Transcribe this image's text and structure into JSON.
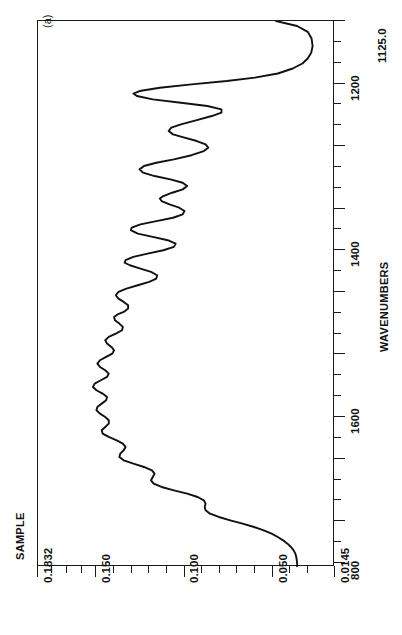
{
  "figure": {
    "panel_label": "(a)",
    "background_color": "#ffffff",
    "line_color": "#111111"
  },
  "chart_data": {
    "type": "line",
    "title": "",
    "subtitle": "",
    "orientation": "rotated-90",
    "xlabel": "WAVENUMBERS",
    "ylabel": "SAMPLE",
    "x_is_vertical_axis": true,
    "xlim": [
      1780,
      1125.0
    ],
    "ylim": [
      0.1832,
      0.0145
    ],
    "x_axis_end_label": "1125.0",
    "grid": false,
    "legend": null,
    "x_major_ticks": [
      1200,
      1400,
      1600,
      800
    ],
    "x_tick_labels": [
      "1200",
      "1400",
      "1600",
      "800"
    ],
    "y_major_ticks": [
      0.1832,
      0.15,
      0.1,
      0.05,
      0.0145
    ],
    "y_tick_labels": [
      "0.1832",
      "0.150",
      "0.100",
      "0.050",
      "0.0145"
    ],
    "series": [
      {
        "name": "SAMPLE",
        "x_label": "wavenumber (cm-1)",
        "y_label": "absorbance",
        "points": [
          [
            1125,
            0.048
          ],
          [
            1131,
            0.036
          ],
          [
            1138,
            0.03
          ],
          [
            1146,
            0.0278
          ],
          [
            1155,
            0.0272
          ],
          [
            1163,
            0.028
          ],
          [
            1170,
            0.03
          ],
          [
            1176,
            0.033
          ],
          [
            1182,
            0.0385
          ],
          [
            1188,
            0.047
          ],
          [
            1193,
            0.06
          ],
          [
            1197,
            0.076
          ],
          [
            1201,
            0.096
          ],
          [
            1205,
            0.114
          ],
          [
            1209,
            0.1255
          ],
          [
            1212,
            0.129
          ],
          [
            1215,
            0.127
          ],
          [
            1219,
            0.118
          ],
          [
            1223,
            0.102
          ],
          [
            1227,
            0.087
          ],
          [
            1231,
            0.079
          ],
          [
            1235,
            0.079
          ],
          [
            1239,
            0.0845
          ],
          [
            1244,
            0.093
          ],
          [
            1249,
            0.102
          ],
          [
            1253,
            0.1075
          ],
          [
            1257,
            0.109
          ],
          [
            1261,
            0.1065
          ],
          [
            1265,
            0.1
          ],
          [
            1269,
            0.093
          ],
          [
            1273,
            0.088
          ],
          [
            1277,
            0.0865
          ],
          [
            1281,
            0.089
          ],
          [
            1286,
            0.096
          ],
          [
            1291,
            0.106
          ],
          [
            1295,
            0.116
          ],
          [
            1299,
            0.123
          ],
          [
            1303,
            0.1255
          ],
          [
            1307,
            0.1235
          ],
          [
            1311,
            0.117
          ],
          [
            1315,
            0.108
          ],
          [
            1319,
            0.101
          ],
          [
            1323,
            0.0985
          ],
          [
            1327,
            0.101
          ],
          [
            1331,
            0.107
          ],
          [
            1335,
            0.112
          ],
          [
            1338,
            0.114
          ],
          [
            1341,
            0.113
          ],
          [
            1345,
            0.1085
          ],
          [
            1349,
            0.103
          ],
          [
            1353,
            0.1
          ],
          [
            1357,
            0.101
          ],
          [
            1361,
            0.1065
          ],
          [
            1365,
            0.116
          ],
          [
            1369,
            0.125
          ],
          [
            1373,
            0.13
          ],
          [
            1376,
            0.1305
          ],
          [
            1380,
            0.1265
          ],
          [
            1384,
            0.118
          ],
          [
            1388,
            0.1095
          ],
          [
            1392,
            0.105
          ],
          [
            1396,
            0.106
          ],
          [
            1400,
            0.112
          ],
          [
            1404,
            0.121
          ],
          [
            1408,
            0.129
          ],
          [
            1412,
            0.1335
          ],
          [
            1415,
            0.134
          ],
          [
            1418,
            0.131
          ],
          [
            1422,
            0.125
          ],
          [
            1426,
            0.119
          ],
          [
            1430,
            0.1155
          ],
          [
            1434,
            0.116
          ],
          [
            1438,
            0.12
          ],
          [
            1442,
            0.1265
          ],
          [
            1446,
            0.133
          ],
          [
            1450,
            0.1375
          ],
          [
            1454,
            0.139
          ],
          [
            1458,
            0.1375
          ],
          [
            1462,
            0.1345
          ],
          [
            1466,
            0.132
          ],
          [
            1470,
            0.132
          ],
          [
            1474,
            0.1345
          ],
          [
            1477,
            0.138
          ],
          [
            1480,
            0.14
          ],
          [
            1484,
            0.1395
          ],
          [
            1488,
            0.137
          ],
          [
            1492,
            0.135
          ],
          [
            1496,
            0.1355
          ],
          [
            1500,
            0.139
          ],
          [
            1504,
            0.143
          ],
          [
            1508,
            0.145
          ],
          [
            1512,
            0.144
          ],
          [
            1516,
            0.1415
          ],
          [
            1520,
            0.14
          ],
          [
            1524,
            0.141
          ],
          [
            1528,
            0.1445
          ],
          [
            1532,
            0.148
          ],
          [
            1536,
            0.1495
          ],
          [
            1540,
            0.148
          ],
          [
            1544,
            0.145
          ],
          [
            1548,
            0.143
          ],
          [
            1552,
            0.144
          ],
          [
            1556,
            0.1475
          ],
          [
            1560,
            0.151
          ],
          [
            1564,
            0.152
          ],
          [
            1568,
            0.15
          ],
          [
            1572,
            0.1465
          ],
          [
            1576,
            0.144
          ],
          [
            1580,
            0.1445
          ],
          [
            1584,
            0.147
          ],
          [
            1588,
            0.1495
          ],
          [
            1592,
            0.15
          ],
          [
            1596,
            0.148
          ],
          [
            1600,
            0.145
          ],
          [
            1604,
            0.143
          ],
          [
            1608,
            0.143
          ],
          [
            1612,
            0.145
          ],
          [
            1616,
            0.147
          ],
          [
            1620,
            0.1465
          ],
          [
            1624,
            0.143
          ],
          [
            1628,
            0.1385
          ],
          [
            1632,
            0.135
          ],
          [
            1636,
            0.1335
          ],
          [
            1640,
            0.1345
          ],
          [
            1644,
            0.1365
          ],
          [
            1648,
            0.137
          ],
          [
            1652,
            0.1345
          ],
          [
            1656,
            0.129
          ],
          [
            1660,
            0.123
          ],
          [
            1664,
            0.1185
          ],
          [
            1668,
            0.117
          ],
          [
            1672,
            0.118
          ],
          [
            1676,
            0.119
          ],
          [
            1680,
            0.1175
          ],
          [
            1684,
            0.113
          ],
          [
            1688,
            0.106
          ],
          [
            1692,
            0.0985
          ],
          [
            1696,
            0.0925
          ],
          [
            1700,
            0.089
          ],
          [
            1704,
            0.088
          ],
          [
            1708,
            0.0885
          ],
          [
            1712,
            0.088
          ],
          [
            1716,
            0.0855
          ],
          [
            1720,
            0.0805
          ],
          [
            1724,
            0.074
          ],
          [
            1728,
            0.067
          ],
          [
            1732,
            0.0605
          ],
          [
            1736,
            0.055
          ],
          [
            1740,
            0.0505
          ],
          [
            1744,
            0.047
          ],
          [
            1748,
            0.044
          ],
          [
            1752,
            0.0415
          ],
          [
            1756,
            0.0395
          ],
          [
            1760,
            0.038
          ],
          [
            1764,
            0.037
          ],
          [
            1768,
            0.0365
          ],
          [
            1772,
            0.0362
          ],
          [
            1776,
            0.036
          ],
          [
            1780,
            0.036
          ]
        ]
      }
    ],
    "notable_peaks": [
      {
        "wavenumber": 1213,
        "absorbance": 0.129,
        "note": "strong band"
      },
      {
        "wavenumber": 1480,
        "absorbance": 0.14,
        "note": "broad strong band"
      },
      {
        "wavenumber": 1720,
        "absorbance": 0.081,
        "note": "shoulder"
      }
    ]
  },
  "axes": {
    "x_axis": {
      "title": "WAVENUMBERS",
      "end_label": "1125.0",
      "ticks": [
        {
          "label": "1125.0",
          "value": 1125,
          "major": true,
          "show_label": false
        },
        {
          "label": "",
          "value": 1150,
          "major": false,
          "show_label": false
        },
        {
          "label": "",
          "value": 1175,
          "major": false,
          "show_label": false
        },
        {
          "label": "1200",
          "value": 1200,
          "major": true,
          "show_label": true
        },
        {
          "label": "",
          "value": 1225,
          "major": false,
          "show_label": false
        },
        {
          "label": "",
          "value": 1250,
          "major": false,
          "show_label": false
        },
        {
          "label": "",
          "value": 1275,
          "major": true,
          "show_label": false
        },
        {
          "label": "",
          "value": 1300,
          "major": false,
          "show_label": false
        },
        {
          "label": "",
          "value": 1325,
          "major": false,
          "show_label": false
        },
        {
          "label": "",
          "value": 1350,
          "major": true,
          "show_label": false
        },
        {
          "label": "",
          "value": 1375,
          "major": false,
          "show_label": false
        },
        {
          "label": "1400",
          "value": 1400,
          "major": true,
          "show_label": true
        },
        {
          "label": "",
          "value": 1425,
          "major": false,
          "show_label": false
        },
        {
          "label": "",
          "value": 1450,
          "major": true,
          "show_label": false
        },
        {
          "label": "",
          "value": 1475,
          "major": false,
          "show_label": false
        },
        {
          "label": "",
          "value": 1500,
          "major": false,
          "show_label": false
        },
        {
          "label": "",
          "value": 1525,
          "major": true,
          "show_label": false
        },
        {
          "label": "",
          "value": 1550,
          "major": false,
          "show_label": false
        },
        {
          "label": "",
          "value": 1575,
          "major": false,
          "show_label": false
        },
        {
          "label": "1600",
          "value": 1600,
          "major": true,
          "show_label": true
        },
        {
          "label": "",
          "value": 1625,
          "major": false,
          "show_label": false
        },
        {
          "label": "",
          "value": 1650,
          "major": true,
          "show_label": false
        },
        {
          "label": "",
          "value": 1675,
          "major": false,
          "show_label": false
        },
        {
          "label": "",
          "value": 1700,
          "major": false,
          "show_label": false
        },
        {
          "label": "",
          "value": 1725,
          "major": true,
          "show_label": false
        },
        {
          "label": "",
          "value": 1750,
          "major": false,
          "show_label": false
        },
        {
          "label": "800",
          "value": 1775,
          "major": true,
          "show_label": true
        }
      ]
    },
    "y_axis": {
      "title": "SAMPLE",
      "ticks": [
        {
          "label": "0.1832",
          "value": 0.1832,
          "major": true,
          "show_label": true
        },
        {
          "label": "",
          "value": 0.175,
          "major": false,
          "show_label": false
        },
        {
          "label": "",
          "value": 0.1667,
          "major": false,
          "show_label": false
        },
        {
          "label": "",
          "value": 0.1583,
          "major": false,
          "show_label": false
        },
        {
          "label": "0.150",
          "value": 0.15,
          "major": true,
          "show_label": true
        },
        {
          "label": "",
          "value": 0.14,
          "major": false,
          "show_label": false
        },
        {
          "label": "",
          "value": 0.13,
          "major": false,
          "show_label": false
        },
        {
          "label": "",
          "value": 0.12,
          "major": false,
          "show_label": false
        },
        {
          "label": "",
          "value": 0.11,
          "major": false,
          "show_label": false
        },
        {
          "label": "0.100",
          "value": 0.1,
          "major": true,
          "show_label": true
        },
        {
          "label": "",
          "value": 0.09,
          "major": false,
          "show_label": false
        },
        {
          "label": "",
          "value": 0.08,
          "major": false,
          "show_label": false
        },
        {
          "label": "",
          "value": 0.07,
          "major": false,
          "show_label": false
        },
        {
          "label": "",
          "value": 0.06,
          "major": false,
          "show_label": false
        },
        {
          "label": "0.050",
          "value": 0.05,
          "major": true,
          "show_label": true
        },
        {
          "label": "",
          "value": 0.04,
          "major": false,
          "show_label": false
        },
        {
          "label": "",
          "value": 0.03,
          "major": false,
          "show_label": false
        },
        {
          "label": "0.0145",
          "value": 0.0145,
          "major": true,
          "show_label": true
        }
      ]
    }
  }
}
